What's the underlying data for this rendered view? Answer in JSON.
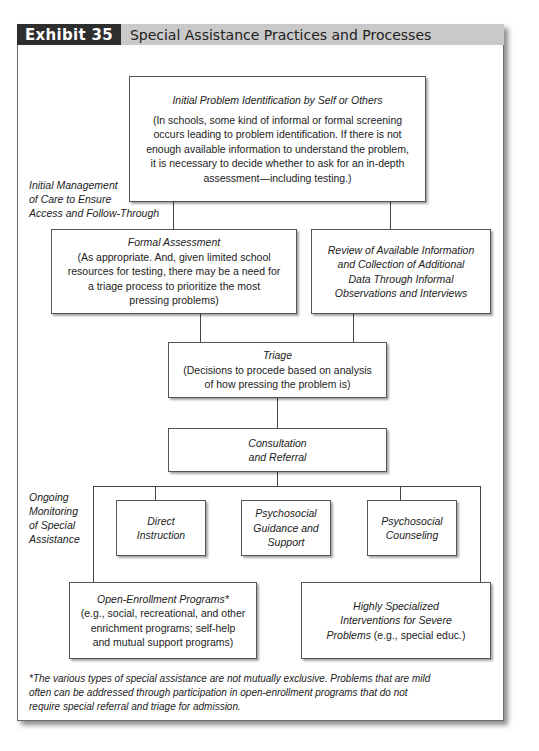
{
  "header": {
    "exhibit_label": "Exhibit 35",
    "title": "Special Assistance Practices and Processes",
    "colors": {
      "tag_bg": "#2e2e2e",
      "bar_bg": "#c9c9c9"
    }
  },
  "side_labels": {
    "initial_management": [
      "Initial Management",
      "of Care to Ensure",
      "Access and Follow-Through"
    ],
    "ongoing_monitoring": [
      "Ongoing",
      "Monitoring",
      "of Special",
      "Assistance"
    ]
  },
  "nodes": {
    "initial_identification": {
      "title": "Initial Problem Identification by Self or Others",
      "body": [
        "(In schools, some kind of informal or formal screening",
        "occurs leading to problem identification. If there is not",
        "enough available information to understand the problem,",
        "it is necessary to decide whether to ask for an in-depth",
        "assessment—including testing.)"
      ]
    },
    "formal_assessment": {
      "title": "Formal Assessment",
      "body": [
        "(As appropriate. And, given limited school",
        "resources for testing, there may be a need for",
        "a triage process to prioritize the most",
        "pressing problems)"
      ]
    },
    "review_information": {
      "title": [
        "Review of Available Information",
        "and Collection of Additional",
        "Data Through Informal",
        "Observations and Interviews"
      ]
    },
    "triage": {
      "title": "Triage",
      "body": [
        "(Decisions to procede based on analysis",
        "of how pressing the problem is)"
      ]
    },
    "consultation": {
      "title": [
        "Consultation",
        "and Referral"
      ]
    },
    "direct_instruction": {
      "title": [
        "Direct",
        "Instruction"
      ]
    },
    "guidance_support": {
      "title": [
        "Psychosocial",
        "Guidance and",
        "Support"
      ]
    },
    "counseling": {
      "title": [
        "Psychosocial",
        "Counseling"
      ]
    },
    "open_enrollment": {
      "title": "Open-Enrollment Programs*",
      "body": [
        "(e.g., social, recreational, and other",
        "enrichment programs; self-help",
        "and mutual support programs)"
      ]
    },
    "specialized": {
      "title": [
        "Highly Specialized",
        "Interventions for Severe"
      ],
      "title_last": "Problems",
      "body_tail": " (e.g., special educ.)"
    }
  },
  "footnote": [
    "*The various types of special assistance are not mutually exclusive. Problems that are mild",
    "often can be addressed through participation in open-enrollment programs that do not",
    "require special referral and triage for admission."
  ]
}
